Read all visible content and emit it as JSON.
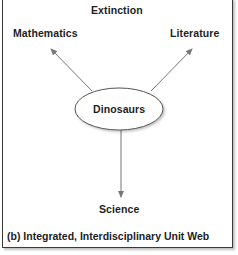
{
  "diagram": {
    "center": {
      "label": "Dinosaurs",
      "shape": "ellipse"
    },
    "nodes": [
      {
        "id": "extinction",
        "label": "Extinction",
        "connected": false
      },
      {
        "id": "mathematics",
        "label": "Mathematics",
        "connected": true
      },
      {
        "id": "literature",
        "label": "Literature",
        "connected": true
      },
      {
        "id": "science",
        "label": "Science",
        "connected": true
      }
    ],
    "edges": [
      {
        "from": "Dinosaurs",
        "to": "Mathematics",
        "type": "arrow"
      },
      {
        "from": "Dinosaurs",
        "to": "Literature",
        "type": "arrow"
      },
      {
        "from": "Dinosaurs",
        "to": "Science",
        "type": "arrow"
      }
    ],
    "caption": "(b) Integrated, Interdisciplinary Unit Web",
    "colors": {
      "text": "#1e1e1e",
      "arrow": "#777777",
      "ellipse_stroke": "#555555",
      "border": "#3a3a3a"
    }
  }
}
